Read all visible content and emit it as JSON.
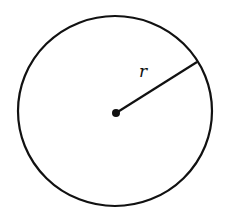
{
  "diagram": {
    "type": "circle-with-radius",
    "colors": {
      "stroke": "#111111",
      "background": "#ffffff"
    },
    "circle": {
      "cx": 115,
      "cy": 111,
      "rx": 97,
      "ry": 95
    },
    "center_point": {
      "x": 116,
      "y": 113
    },
    "radius_line": {
      "x1": 116,
      "y1": 113,
      "x2": 197,
      "y2": 62
    },
    "radius_label": {
      "text": "r",
      "x": 139,
      "y": 77
    }
  }
}
